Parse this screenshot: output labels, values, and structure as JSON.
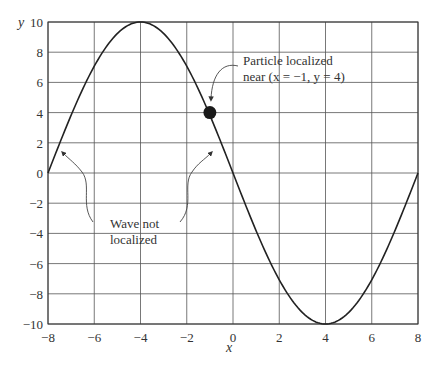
{
  "chart_data": {
    "type": "line",
    "title": "",
    "xlabel": "x",
    "ylabel": "y",
    "xlim": [
      -8,
      8
    ],
    "ylim": [
      -10,
      10
    ],
    "xticks": [
      -8,
      -6,
      -4,
      -2,
      0,
      2,
      4,
      6,
      8
    ],
    "yticks": [
      -10,
      -8,
      -6,
      -4,
      -2,
      0,
      2,
      4,
      6,
      8,
      10
    ],
    "xtick_labels": [
      "−8",
      "−6",
      "−4",
      "−2",
      "0",
      "2",
      "4",
      "6",
      "8"
    ],
    "ytick_labels": [
      "−10",
      "−8",
      "−6",
      "−4",
      "−2",
      "0",
      "2",
      "4",
      "6",
      "8",
      "10"
    ],
    "grid": true,
    "legend": null,
    "series": [
      {
        "name": "wave",
        "formula": "y = -10 sin(pi x / 8)",
        "x": [
          -8,
          -7,
          -6,
          -5,
          -4,
          -3,
          -2,
          -1,
          0,
          1,
          2,
          3,
          4,
          5,
          6,
          7,
          8
        ],
        "y": [
          0,
          3.83,
          7.07,
          9.24,
          10,
          9.24,
          7.07,
          3.83,
          0,
          -3.83,
          -7.07,
          -9.24,
          -10,
          -9.24,
          -7.07,
          -3.83,
          0
        ]
      }
    ],
    "points": [
      {
        "name": "particle",
        "x": -1,
        "y": 4
      }
    ],
    "annotations": [
      {
        "id": "particle",
        "lines": [
          "Particle localized",
          "near (x = −1, y = 4)"
        ]
      },
      {
        "id": "wave",
        "lines": [
          "Wave not",
          "localized"
        ]
      }
    ]
  }
}
